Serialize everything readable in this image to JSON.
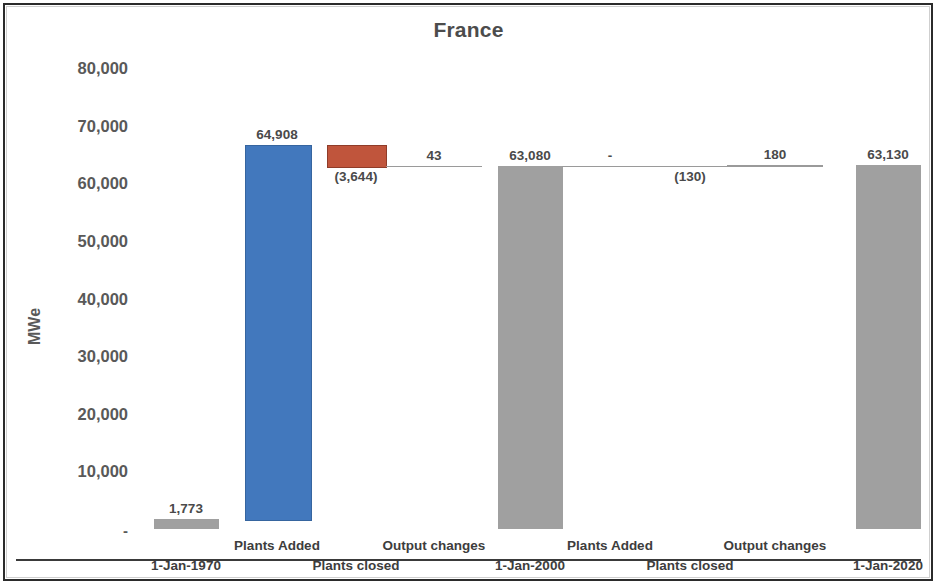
{
  "chart_data": {
    "type": "bar",
    "subtype": "waterfall",
    "title": "France",
    "xlabel": "",
    "ylabel": "MWe",
    "ylim": [
      0,
      80000
    ],
    "yticks": [
      0,
      10000,
      20000,
      30000,
      40000,
      50000,
      60000,
      70000,
      80000
    ],
    "ytick_labels": [
      "-",
      "10,000",
      "20,000",
      "30,000",
      "40,000",
      "50,000",
      "60,000",
      "70,000",
      "80,000"
    ],
    "grid": false,
    "legend": "none",
    "categories": [
      "1-Jan-1970",
      "Plants Added",
      "Plants closed",
      "Output changes",
      "1-Jan-2000",
      "Plants Added",
      "Plants closed",
      "Output changes",
      "1-Jan-2020"
    ],
    "category_rows": [
      1,
      0,
      1,
      0,
      1,
      0,
      1,
      0,
      1
    ],
    "data_labels": [
      "1,773",
      "64,908",
      "(3,644)",
      "43",
      "63,080",
      "-",
      "(130)",
      "180",
      "63,130"
    ],
    "values": [
      1773,
      64908,
      -3644,
      43,
      63080,
      0,
      -130,
      180,
      63130
    ],
    "kinds": [
      "total",
      "increase",
      "decrease",
      "increase",
      "total",
      "increase",
      "decrease",
      "increase",
      "total"
    ],
    "bar_bases": [
      0,
      1773,
      63037,
      63037,
      0,
      63080,
      62950,
      62950,
      0
    ],
    "bar_tops": [
      1773,
      66681,
      66681,
      63080,
      63080,
      63080,
      63080,
      63130,
      63130
    ],
    "colors": {
      "increase": "#4278bd",
      "decrease": "#c0553c",
      "total": "#a0a0a0",
      "connector": "#9a9a9a",
      "axis": "#6e6e6e",
      "text": "#4a4a4a",
      "title": "#4c4c4c",
      "border": "#2b2b2b",
      "background": "#ffffff"
    }
  }
}
